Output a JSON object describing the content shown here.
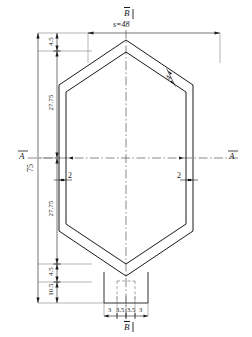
{
  "drawing": {
    "title_top": "B",
    "title_bottom": "B",
    "section_left": "A",
    "section_right": "A",
    "across_flats": "s=48",
    "overall_height": "75",
    "vertical_chain": [
      "4.5",
      "27.75",
      "27.75",
      "4.5",
      "10.5"
    ],
    "bottom_chain": [
      "3",
      "3.5",
      "3.5",
      "3"
    ],
    "wall_thickness_left": "2",
    "wall_thickness_right": "2",
    "wall_thickness_slant": "4",
    "colors": {
      "line": "#1a1a1a",
      "thin": "#555555",
      "background": "#ffffff"
    }
  }
}
